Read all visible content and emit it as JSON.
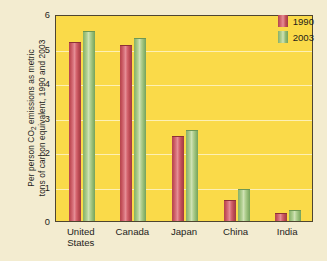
{
  "chart_data": {
    "type": "bar",
    "title": "",
    "xlabel": "",
    "ylabel_line1": "Per person CO",
    "ylabel_sub": "2",
    "ylabel_line1_rest": " emissions as metric",
    "ylabel_line2": "tons of carbon equivalent, 1990 and 2003",
    "categories": [
      "United States",
      "Canada",
      "Japan",
      "China",
      "India"
    ],
    "category_lines": [
      [
        "United",
        "States"
      ],
      [
        "Canada"
      ],
      [
        "Japan"
      ],
      [
        "China"
      ],
      [
        "India"
      ]
    ],
    "series": [
      {
        "name": "1990",
        "color": "#c4515a",
        "values": [
          5.2,
          5.1,
          2.45,
          0.62,
          0.22
        ]
      },
      {
        "name": "2003",
        "color": "#97bd77",
        "values": [
          5.5,
          5.3,
          2.65,
          0.93,
          0.32
        ]
      }
    ],
    "ylim": [
      0,
      6
    ],
    "yticks": [
      0,
      1,
      2,
      3,
      4,
      5,
      6
    ],
    "ytick_labels": [
      "0",
      "1",
      "2",
      "3",
      "4",
      "5",
      "6"
    ],
    "grid": true,
    "legend_position": "top-right",
    "plot_background": "#fada49",
    "page_background": "#f3ecd0",
    "gridline_color": "#fdf0b4",
    "axis_color": "#4e4530"
  }
}
